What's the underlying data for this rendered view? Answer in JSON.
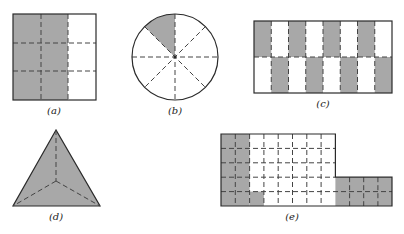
{
  "colors": {
    "shade": "#a8a8a8",
    "line": "#2a2a2a",
    "dash": "#444444",
    "background": "#ffffff"
  },
  "figures": [
    {
      "id": "a",
      "label": "(a)",
      "shape": "square",
      "grid": {
        "cols": 3,
        "rows": 3
      },
      "shaded_cells": "columns 1-2 of 3 (6 of 9 cells)"
    },
    {
      "id": "b",
      "label": "(b)",
      "shape": "circle",
      "sectors": 8,
      "shaded_sectors": 1
    },
    {
      "id": "c",
      "label": "(c)",
      "shape": "rectangle",
      "grid": {
        "cols": 8,
        "rows": 2
      },
      "shaded_cells": "checkerboard, 8 of 16 cells"
    },
    {
      "id": "d",
      "label": "(d)",
      "shape": "triangle",
      "parts": 3,
      "shaded_parts": 3
    },
    {
      "id": "e",
      "label": "(e)",
      "shape": "L-shaped region",
      "grid": {
        "main_cols": 8,
        "main_rows": 5,
        "extension_cols": 4,
        "extension_rows": 2
      },
      "shaded_cells": "columns 1-2 full height, column 3 bottom cell, and the 4x2 extension (19 of 48 cells)"
    }
  ]
}
